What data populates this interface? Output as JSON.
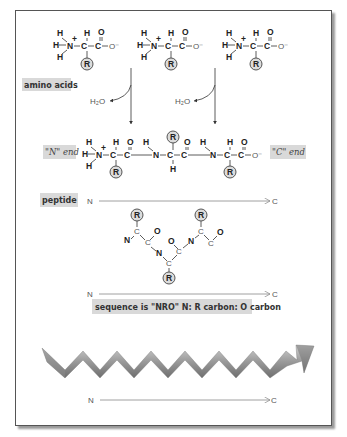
{
  "labels": {
    "amino_acids": "amino acids",
    "water": "H₂O",
    "n_end": "\"N\" end",
    "c_end": "\"C\" end",
    "peptide": "peptide",
    "sequence_caption": "sequence is \"NRO\" N: R carbon: O carbon"
  },
  "atoms": {
    "H": "H",
    "N": "N",
    "C": "C",
    "O": "O",
    "O_minus": "O⁻",
    "R": "R",
    "plus": "+"
  },
  "axes": [
    {
      "start": "N",
      "end": "C"
    },
    {
      "start": "N",
      "end": "C"
    },
    {
      "start": "N",
      "end": "C"
    }
  ],
  "colors": {
    "frame_border": "#555555",
    "label_box": "#d9d9d9",
    "r_group_fill": "#dcdcdc",
    "ribbon_light": "#c8c8c8",
    "ribbon_dark": "#7a7a7a"
  }
}
